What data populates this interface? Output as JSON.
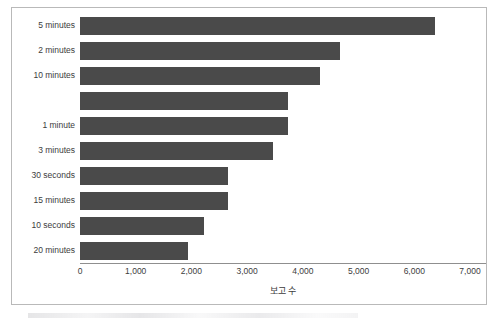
{
  "chart_data": {
    "type": "bar",
    "orientation": "horizontal",
    "title": "",
    "xlabel": "보고 수",
    "ylabel": "",
    "xlim": [
      0,
      7000
    ],
    "xticks": [
      "0",
      "1,000",
      "2,000",
      "3,000",
      "4,000",
      "5,000",
      "6,000",
      "7,000"
    ],
    "xtick_values": [
      0,
      1000,
      2000,
      3000,
      4000,
      5000,
      6000,
      7000
    ],
    "grid": false,
    "legend": false,
    "bar_color": "#4a4a4a",
    "categories": [
      "5 minutes",
      "2 minutes",
      "10 minutes",
      "",
      "1 minute",
      "3 minutes",
      "30 seconds",
      "15 minutes",
      "10 seconds",
      "20 minutes"
    ],
    "values": [
      6370,
      4660,
      4300,
      3730,
      3730,
      3460,
      2660,
      2660,
      2230,
      1930
    ]
  }
}
